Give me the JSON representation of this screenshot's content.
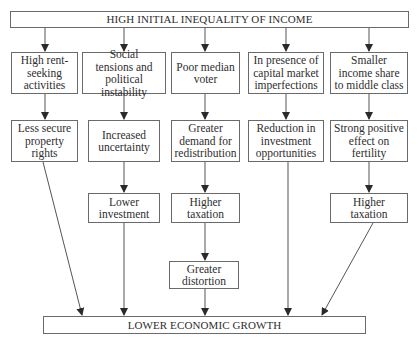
{
  "diagram": {
    "top": "HIGH INITIAL INEQUALITY OF INCOME",
    "bottom": "LOWER ECONOMIC GROWTH",
    "columns": [
      {
        "cause": "High rent-\nseeking\nactivities",
        "steps": [
          "Less secure\nproperty\nrights"
        ]
      },
      {
        "cause": "Social\ntensions and\npolitical instability",
        "steps": [
          "Increased\nuncertainty",
          "Lower\ninvestment"
        ]
      },
      {
        "cause": "Poor median\nvoter",
        "steps": [
          "Greater\ndemand for\nredistribution",
          "Higher\ntaxation",
          "Greater\ndistortion"
        ]
      },
      {
        "cause": "In presence of\ncapital market\nimperfections",
        "steps": [
          "Reduction in\ninvestment\nopportunities"
        ]
      },
      {
        "cause": "Smaller\nincome share\nto middle class",
        "steps": [
          "Strong positive\neffect on\nfertility",
          "Higher\ntaxation"
        ]
      }
    ]
  },
  "colors": {
    "line": "#555555",
    "border": "#6a6a6a",
    "text": "#2e2e2e"
  }
}
